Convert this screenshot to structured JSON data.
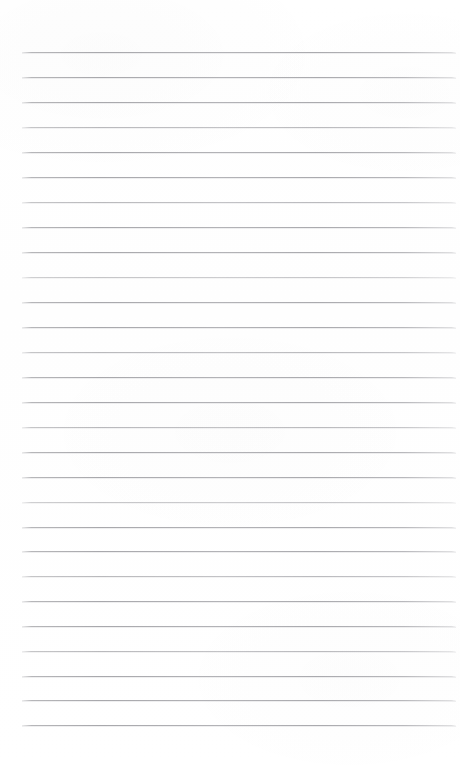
{
  "document": {
    "type": "scanned-lined-paper",
    "title": "Blank ruled notebook page",
    "content_text": "",
    "background_color": "#ffffff",
    "rule_color": "#acacb0",
    "page_width": 460,
    "page_height": 771
  },
  "ruling": {
    "line_count": 28,
    "first_line_y": 52,
    "line_spacing": 24.9,
    "line_left_x": 22,
    "line_right_x": 456,
    "line_thickness": 1,
    "lines": [
      {
        "index": 1,
        "y": 52,
        "opacity_class": ""
      },
      {
        "index": 2,
        "y": 77,
        "opacity_class": ""
      },
      {
        "index": 3,
        "y": 102,
        "opacity_class": ""
      },
      {
        "index": 4,
        "y": 127,
        "opacity_class": "faint"
      },
      {
        "index": 5,
        "y": 152,
        "opacity_class": ""
      },
      {
        "index": 6,
        "y": 177,
        "opacity_class": ""
      },
      {
        "index": 7,
        "y": 202,
        "opacity_class": "faint"
      },
      {
        "index": 8,
        "y": 227,
        "opacity_class": ""
      },
      {
        "index": 9,
        "y": 252,
        "opacity_class": ""
      },
      {
        "index": 10,
        "y": 277,
        "opacity_class": "fainter"
      },
      {
        "index": 11,
        "y": 302,
        "opacity_class": ""
      },
      {
        "index": 12,
        "y": 327,
        "opacity_class": ""
      },
      {
        "index": 13,
        "y": 352,
        "opacity_class": "faint"
      },
      {
        "index": 14,
        "y": 377,
        "opacity_class": ""
      },
      {
        "index": 15,
        "y": 402,
        "opacity_class": ""
      },
      {
        "index": 16,
        "y": 427,
        "opacity_class": "faint"
      },
      {
        "index": 17,
        "y": 452,
        "opacity_class": ""
      },
      {
        "index": 18,
        "y": 477,
        "opacity_class": ""
      },
      {
        "index": 19,
        "y": 502,
        "opacity_class": "fainter"
      },
      {
        "index": 20,
        "y": 527,
        "opacity_class": ""
      },
      {
        "index": 21,
        "y": 551,
        "opacity_class": ""
      },
      {
        "index": 22,
        "y": 576,
        "opacity_class": "faint"
      },
      {
        "index": 23,
        "y": 601,
        "opacity_class": ""
      },
      {
        "index": 24,
        "y": 626,
        "opacity_class": ""
      },
      {
        "index": 25,
        "y": 651,
        "opacity_class": "faint"
      },
      {
        "index": 26,
        "y": 676,
        "opacity_class": ""
      },
      {
        "index": 27,
        "y": 700,
        "opacity_class": ""
      },
      {
        "index": 28,
        "y": 725,
        "opacity_class": ""
      }
    ]
  }
}
